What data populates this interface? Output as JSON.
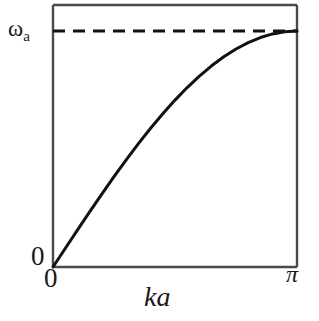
{
  "figure": {
    "kind": "dispersion-relation-plot",
    "background_color": "#ffffff",
    "line_color": "#111111",
    "frame_color": "#4a4a4a"
  },
  "axes": {
    "y_top_label": "ω",
    "y_top_label_subscript": "a",
    "y_origin_label": "0",
    "x_origin_label": "0",
    "x_end_label": "π",
    "x_axis_title": "ka"
  },
  "chart_data": {
    "type": "line",
    "title": "",
    "subtitle": "",
    "xlabel": "ka",
    "ylabel": "ω",
    "xlim": [
      0,
      3.14159
    ],
    "ylim": [
      0,
      1
    ],
    "xticks": [
      0,
      3.14159
    ],
    "xticklabels": [
      "0",
      "π"
    ],
    "yticks": [
      0,
      1
    ],
    "yticklabels": [
      "0",
      "ωa"
    ],
    "grid": false,
    "legend": null,
    "series": [
      {
        "name": "acoustic-branch",
        "style": "solid",
        "color": "#111111",
        "width": 3,
        "formula": "omega = omega_a * sin(ka/2)",
        "x": [
          0,
          0.15708,
          0.31416,
          0.47124,
          0.62832,
          0.7854,
          0.94248,
          1.09956,
          1.25664,
          1.41372,
          1.5708,
          1.72788,
          1.88496,
          2.04204,
          2.19911,
          2.35619,
          2.51327,
          2.67035,
          2.82743,
          2.98451,
          3.14159
        ],
        "y": [
          0,
          0.07846,
          0.15643,
          0.2334,
          0.30902,
          0.38268,
          0.45399,
          0.5225,
          0.58779,
          0.64945,
          0.70711,
          0.76041,
          0.80902,
          0.85264,
          0.89101,
          0.92388,
          0.95106,
          0.97237,
          0.98769,
          0.99692,
          1.0
        ]
      },
      {
        "name": "omega-a-asymptote",
        "style": "dashed",
        "color": "#111111",
        "width": 2.6,
        "dash_pattern": "12 8",
        "x": [
          0,
          3.14159
        ],
        "y": [
          1.0,
          1.0
        ]
      }
    ],
    "annotations": [
      {
        "text": "ωa",
        "role": "y-max-tick",
        "x": 0,
        "y": 1.0
      },
      {
        "text": "0",
        "role": "y-min-tick",
        "x": 0,
        "y": 0
      },
      {
        "text": "0",
        "role": "x-min-tick",
        "x": 0,
        "y": 0
      },
      {
        "text": "π",
        "role": "x-max-tick",
        "x": 3.14159,
        "y": 0
      },
      {
        "text": "ka",
        "role": "x-axis-title",
        "x": 1.5708,
        "y": 0
      }
    ]
  }
}
